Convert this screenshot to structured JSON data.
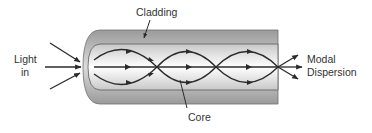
{
  "diagram": {
    "labels": {
      "cladding": "Cladding",
      "light_in_line1": "Light",
      "light_in_line2": "in",
      "core": "Core",
      "output_line1": "Modal",
      "output_line2": "Dispersion"
    },
    "colors": {
      "line": "#2b2b2b",
      "cladding_dark": "#8f8f8f",
      "cladding_light": "#d9d9d9",
      "core_center": "#ffffff",
      "core_edge": "#cfcfcf",
      "text": "#333333"
    }
  }
}
